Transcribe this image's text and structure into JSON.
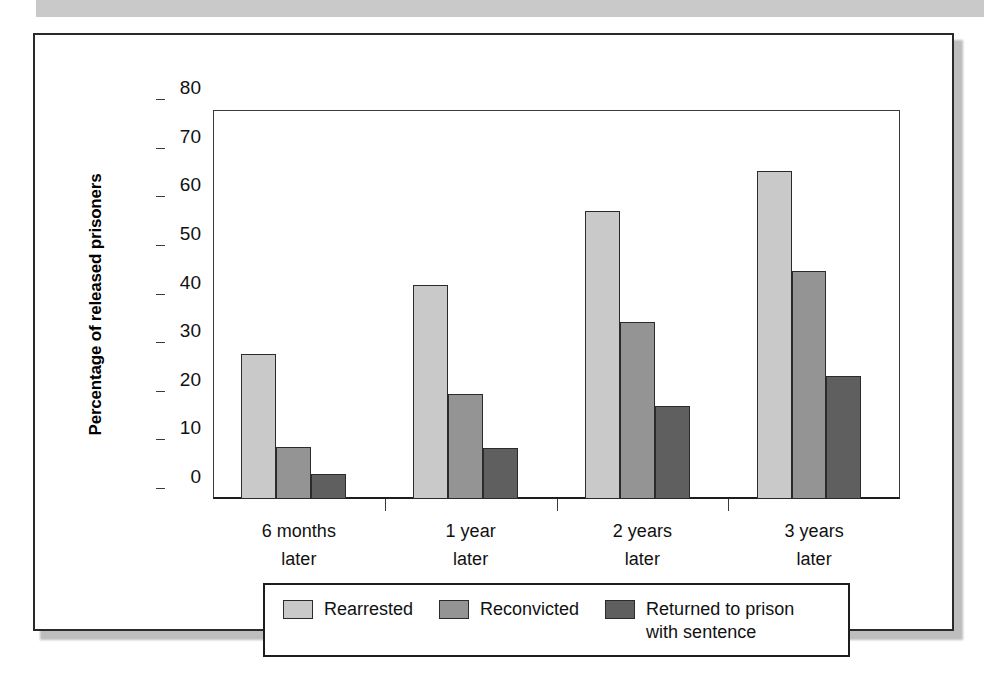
{
  "figure": {
    "top_band_color": "#c9c9c9",
    "frame_color": "#1d1d1d",
    "background": "#ffffff"
  },
  "chart_data": {
    "type": "bar",
    "title": "",
    "xlabel": "",
    "ylabel": "Percentage of released prisoners",
    "ylim": [
      0,
      80
    ],
    "yticks": [
      0,
      10,
      20,
      30,
      40,
      50,
      60,
      70,
      80
    ],
    "ytick_labels": [
      "0",
      "10",
      "20",
      "30",
      "40",
      "50",
      "60",
      "70",
      "80"
    ],
    "grid": false,
    "legend_position": "bottom",
    "categories": [
      "6 months later",
      "1 year later",
      "2 years later",
      "3 years later"
    ],
    "category_lines": [
      [
        "6 months",
        "later"
      ],
      [
        "1 year",
        "later"
      ],
      [
        "2 years",
        "later"
      ],
      [
        "3 years",
        "later"
      ]
    ],
    "series": [
      {
        "name": "Rearrested",
        "color": "#c9c9c9",
        "values": [
          29.9,
          44.1,
          59.2,
          67.5
        ]
      },
      {
        "name": "Reconvicted",
        "color": "#949494",
        "values": [
          10.6,
          21.5,
          36.4,
          46.8
        ]
      },
      {
        "name": "Returned to prison with sentence",
        "color": "#5f5f5f",
        "values": [
          5.2,
          10.4,
          19.1,
          25.4
        ],
        "label_lines": [
          "Returned to prison",
          "with sentence"
        ]
      }
    ]
  }
}
